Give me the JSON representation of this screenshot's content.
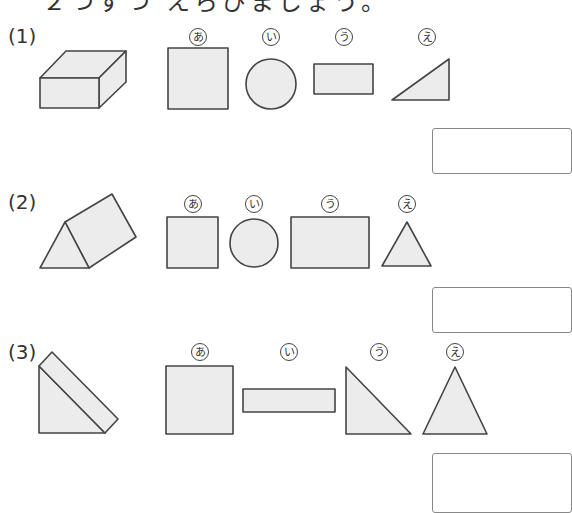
{
  "instruction": "２つずつ えらびましょう。",
  "questions": [
    {
      "number": "(1)",
      "solid": "cuboid",
      "options": [
        {
          "label": "あ",
          "shape": "square"
        },
        {
          "label": "い",
          "shape": "circle"
        },
        {
          "label": "う",
          "shape": "rectangle"
        },
        {
          "label": "え",
          "shape": "right-triangle"
        }
      ],
      "answer": ""
    },
    {
      "number": "(2)",
      "solid": "triangular-prism",
      "options": [
        {
          "label": "あ",
          "shape": "square"
        },
        {
          "label": "い",
          "shape": "circle"
        },
        {
          "label": "う",
          "shape": "rectangle"
        },
        {
          "label": "え",
          "shape": "equilateral-triangle"
        }
      ],
      "answer": ""
    },
    {
      "number": "(3)",
      "solid": "right-triangular-prism",
      "options": [
        {
          "label": "あ",
          "shape": "square"
        },
        {
          "label": "い",
          "shape": "thin-rectangle"
        },
        {
          "label": "う",
          "shape": "right-triangle"
        },
        {
          "label": "え",
          "shape": "isosceles-triangle"
        }
      ],
      "answer": ""
    }
  ],
  "colors": {
    "fill": "#ececec",
    "stroke": "#444444"
  }
}
